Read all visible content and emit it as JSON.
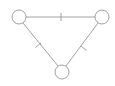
{
  "diagram": {
    "type": "graph",
    "stroke_color": "#808080",
    "fill_color": "#ffffff",
    "nodes": [
      {
        "id": "top-left",
        "cx": 19,
        "cy": 17,
        "r": 7
      },
      {
        "id": "top-right",
        "cx": 102,
        "cy": 17,
        "r": 7
      },
      {
        "id": "bottom",
        "cx": 62,
        "cy": 72,
        "r": 7
      }
    ],
    "edges": [
      {
        "from": "top-left",
        "to": "top-right",
        "tick_marks": 1
      },
      {
        "from": "top-left",
        "to": "bottom",
        "tick_marks": 1
      },
      {
        "from": "top-right",
        "to": "bottom",
        "tick_marks": 1
      }
    ]
  }
}
